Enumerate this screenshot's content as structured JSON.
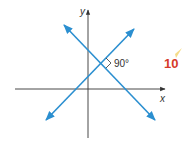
{
  "diagram": {
    "type": "coordinate-plane-perpendicular-lines",
    "axes": {
      "x_label": "x",
      "y_label": "y",
      "color": "#333333"
    },
    "lines": [
      {
        "name": "rising-line",
        "color": "#2b8fd0"
      },
      {
        "name": "falling-line",
        "color": "#2b8fd0"
      }
    ],
    "angle": {
      "label": "90°",
      "marker": "right-angle"
    },
    "exercise_number": {
      "label": "10",
      "color": "#d63a2a",
      "highlight_color": "#f2d36b"
    }
  }
}
